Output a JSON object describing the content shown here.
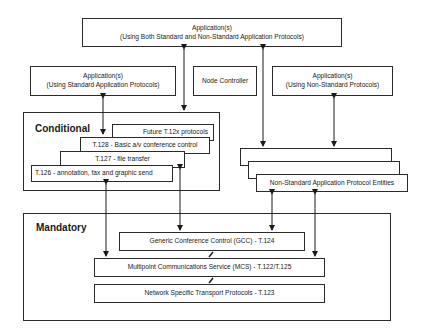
{
  "top_app": {
    "line1": "Application(s)",
    "line2": "(Using Both Standard and Non-Standard Application Protocols)"
  },
  "std_app": {
    "line1": "Application(s)",
    "line2": "(Using Standard Application Protocols)"
  },
  "node_controller": {
    "label": "Node Controller"
  },
  "nonstd_app": {
    "line1": "Application(s)",
    "line2": "(Using Non-Standard Protocols)"
  },
  "conditional": {
    "title": "Conditional",
    "layers": [
      "Future T.12x protocols",
      "T.128 - Basic a/v conference control",
      "T.127 - file transfer",
      "T.126 - annotation, fax and graphic send"
    ]
  },
  "nonstd_entities": {
    "label": "Non-Standard Application Protocol Entities"
  },
  "mandatory": {
    "title": "Mandatory",
    "layers": [
      "Generic Conference Control (GCC) - T.124",
      "Multipoint Communications Service (MCS) - T.122/T.125",
      "Network Specific Transport Protocols - T.123"
    ]
  }
}
